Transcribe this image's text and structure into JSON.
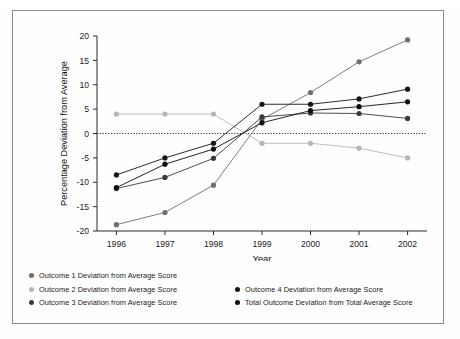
{
  "figure": {
    "background_color": "#fdfdfd",
    "frame_color": "#8d8d8d"
  },
  "chart_data": {
    "type": "line",
    "title": "",
    "xlabel": "Year",
    "ylabel": "Percentage Deviation from Average",
    "categories": [
      "1996",
      "1997",
      "1998",
      "1999",
      "2000",
      "2001",
      "2002"
    ],
    "x": [
      1996,
      1997,
      1998,
      1999,
      2000,
      2001,
      2002
    ],
    "xlim": [
      1995.6,
      2002.4
    ],
    "ylim": [
      -20,
      20
    ],
    "yticks": [
      -20,
      -15,
      -10,
      -5,
      0,
      5,
      10,
      15,
      20
    ],
    "ytick_labels": [
      "-20",
      "-15",
      "-10",
      "-5",
      "0",
      "5",
      "10",
      "15",
      "20"
    ],
    "grid": false,
    "zero_line": true,
    "zero_line_style": "dotted",
    "legend_position": "below",
    "series": [
      {
        "name": "Outcome 1 Deviation from Average Score",
        "color": "#6e6e6e",
        "values": [
          -18.7,
          -16.2,
          -10.6,
          2.9,
          8.4,
          14.7,
          19.2
        ]
      },
      {
        "name": "Outcome 2 Deviation from Average Score",
        "color": "#b5b5b5",
        "values": [
          4.0,
          4.0,
          4.0,
          -2.0,
          -2.0,
          -3.0,
          -5.0
        ]
      },
      {
        "name": "Outcome 3 Deviation from Average Score",
        "color": "#3a3a3a",
        "values": [
          -11.3,
          -9.0,
          -5.1,
          3.4,
          4.2,
          4.1,
          3.1
        ]
      },
      {
        "name": "Outcome 4 Deviation from Average Score",
        "color": "#151515",
        "values": [
          -8.5,
          -5.0,
          -2.0,
          6.0,
          6.0,
          7.1,
          9.1
        ]
      },
      {
        "name": "Total Outcome Deviation from Total Average Score",
        "color": "#0d0d0d",
        "values": [
          -11.1,
          -6.3,
          -3.2,
          2.2,
          4.7,
          5.5,
          6.5
        ]
      }
    ]
  },
  "legend": {
    "left_column": [
      {
        "label": "Outcome 1 Deviation from Average Score",
        "color": "#6e6e6e"
      },
      {
        "label": "Outcome 2 Deviation from Average Score",
        "color": "#b5b5b5"
      },
      {
        "label": "Outcome 3 Deviation from Average Score",
        "color": "#3a3a3a"
      }
    ],
    "right_column": [
      {
        "label": "Outcome 4 Deviation from Average Score",
        "color": "#151515"
      },
      {
        "label": "Total Outcome Deviation from Total Average Score",
        "color": "#0d0d0d"
      }
    ]
  }
}
